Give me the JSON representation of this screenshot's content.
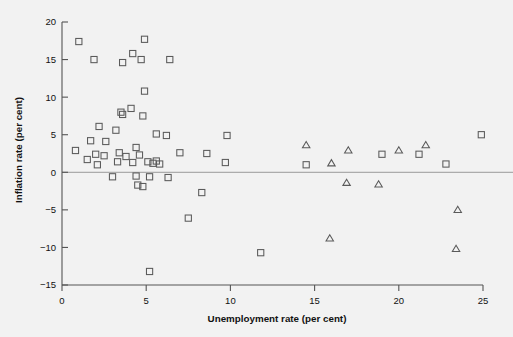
{
  "chart_data": {
    "type": "scatter",
    "title": "",
    "xlabel": "Unemployment rate (per cent)",
    "ylabel": "Inflation rate (per cent)",
    "xlim": [
      0,
      25
    ],
    "ylim": [
      -15,
      20
    ],
    "xticks": [
      0,
      5,
      10,
      15,
      20,
      25
    ],
    "yticks": [
      20,
      15,
      10,
      5,
      0,
      -5,
      -10,
      -15
    ],
    "xtick_labels": [
      "0",
      "5",
      "10",
      "15",
      "20",
      "25"
    ],
    "ytick_labels": [
      "20",
      "15",
      "10",
      "5",
      "0",
      "−5",
      "−10",
      "−15"
    ],
    "grid": false,
    "legend": "none",
    "zero_reference_line": 0,
    "marker_color": "#5a5a5a",
    "background_color": "#f2f2f2",
    "series": [
      {
        "name": "square-series",
        "marker": "open-square",
        "points": [
          [
            1.0,
            17.4
          ],
          [
            1.9,
            15.0
          ],
          [
            3.6,
            14.6
          ],
          [
            4.2,
            15.8
          ],
          [
            4.7,
            15.0
          ],
          [
            4.9,
            17.7
          ],
          [
            6.4,
            15.0
          ],
          [
            4.9,
            10.8
          ],
          [
            3.5,
            8.0
          ],
          [
            3.6,
            7.7
          ],
          [
            4.1,
            8.5
          ],
          [
            4.8,
            7.5
          ],
          [
            2.2,
            6.1
          ],
          [
            3.2,
            5.6
          ],
          [
            5.6,
            5.1
          ],
          [
            6.2,
            4.9
          ],
          [
            9.8,
            4.9
          ],
          [
            1.7,
            4.2
          ],
          [
            2.6,
            4.1
          ],
          [
            24.9,
            5.0
          ],
          [
            0.8,
            2.9
          ],
          [
            1.5,
            1.7
          ],
          [
            2.0,
            2.4
          ],
          [
            2.5,
            2.2
          ],
          [
            3.4,
            2.6
          ],
          [
            3.8,
            2.1
          ],
          [
            4.4,
            3.3
          ],
          [
            4.6,
            2.3
          ],
          [
            7.0,
            2.6
          ],
          [
            8.6,
            2.5
          ],
          [
            21.2,
            2.4
          ],
          [
            19.0,
            2.4
          ],
          [
            2.1,
            1.0
          ],
          [
            3.3,
            1.4
          ],
          [
            4.2,
            1.3
          ],
          [
            5.1,
            1.4
          ],
          [
            5.4,
            1.2
          ],
          [
            5.6,
            1.5
          ],
          [
            5.8,
            1.1
          ],
          [
            9.7,
            1.3
          ],
          [
            14.5,
            1.0
          ],
          [
            22.8,
            1.1
          ],
          [
            3.0,
            -0.6
          ],
          [
            4.4,
            -0.5
          ],
          [
            5.2,
            -0.6
          ],
          [
            6.3,
            -0.7
          ],
          [
            4.5,
            -1.7
          ],
          [
            4.8,
            -1.9
          ],
          [
            8.3,
            -2.7
          ],
          [
            7.5,
            -6.1
          ],
          [
            11.8,
            -10.7
          ],
          [
            5.2,
            -13.2
          ]
        ]
      },
      {
        "name": "triangle-series",
        "marker": "open-triangle",
        "points": [
          [
            14.5,
            3.6
          ],
          [
            17.0,
            2.9
          ],
          [
            20.0,
            2.9
          ],
          [
            21.6,
            3.6
          ],
          [
            16.0,
            1.2
          ],
          [
            16.9,
            -1.4
          ],
          [
            18.8,
            -1.6
          ],
          [
            23.5,
            -5.0
          ],
          [
            15.9,
            -8.8
          ],
          [
            23.4,
            -10.2
          ]
        ]
      }
    ]
  }
}
